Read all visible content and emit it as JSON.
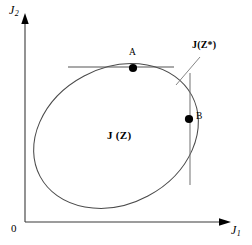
{
  "figure": {
    "type": "diagram",
    "background_color": "#ffffff",
    "stroke_color": "#000000"
  },
  "axes": {
    "y_label": "J",
    "y_subscript": "2",
    "x_label": "J",
    "x_subscript": "1",
    "origin_label": "0",
    "y_axis": {
      "x": 25,
      "top": 16,
      "bottom": 222,
      "arrow": "up"
    },
    "x_axis": {
      "y": 222,
      "left": 25,
      "right": 228,
      "arrow": "right"
    }
  },
  "region": {
    "label": "J (Z)",
    "shape": "ellipse",
    "center_x": 116,
    "center_y": 136,
    "radius_x": 86,
    "radius_y": 68,
    "rotation_deg": -28
  },
  "points": [
    {
      "id": "A",
      "label": "A",
      "x": 133,
      "y": 68,
      "label_x": 129,
      "label_y": 51,
      "tangent": "horizontal"
    },
    {
      "id": "B",
      "label": "B",
      "x": 189,
      "y": 119,
      "label_x": 196,
      "label_y": 113,
      "tangent": "vertical"
    }
  ],
  "tangent_lines": [
    {
      "name": "horizontal-tangent-at-A",
      "x1": 68,
      "y1": 67,
      "x2": 174,
      "y2": 67
    },
    {
      "name": "vertical-tangent-at-B",
      "x1": 190,
      "y1": 73,
      "x2": 190,
      "y2": 185
    }
  ],
  "callout": {
    "label": "J(Z*)",
    "label_x": 192,
    "label_y": 46,
    "leader": {
      "x1": 176,
      "y1": 84,
      "x2": 200,
      "y2": 58
    }
  }
}
